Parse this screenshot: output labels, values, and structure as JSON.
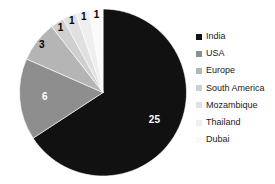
{
  "chart_data": {
    "type": "pie",
    "title": "",
    "categories": [
      "India",
      "USA",
      "Europe",
      "South America",
      "Mozambique",
      "Thailand",
      "Dubai"
    ],
    "values": [
      25,
      6,
      3,
      1,
      1,
      1,
      1
    ],
    "total": 38,
    "data_labels": [
      "25",
      "6",
      "3",
      "1",
      "1",
      "1",
      "1"
    ],
    "colors": [
      "#111111",
      "#8e8e8e",
      "#b5b5b5",
      "#cfcfcf",
      "#e0e0e0",
      "#efefef",
      "#fafafa"
    ],
    "label_colors": [
      "#ffffff",
      "#ffffff",
      "#000000",
      "#000000",
      "#000000",
      "#000000",
      "#000000"
    ],
    "start_angle_deg": 0,
    "direction": "clockwise",
    "legend_position": "right",
    "grid": false,
    "xlabel": "",
    "ylabel": ""
  },
  "legend": {
    "items": [
      {
        "label": "India",
        "color": "#111111"
      },
      {
        "label": "USA",
        "color": "#8e8e8e"
      },
      {
        "label": "Europe",
        "color": "#b5b5b5"
      },
      {
        "label": "South America",
        "color": "#cfcfcf"
      },
      {
        "label": "Mozambique",
        "color": "#e0e0e0"
      },
      {
        "label": "Thailand",
        "color": "#efefef"
      },
      {
        "label": "Dubai",
        "color": "#fafafa"
      }
    ]
  }
}
